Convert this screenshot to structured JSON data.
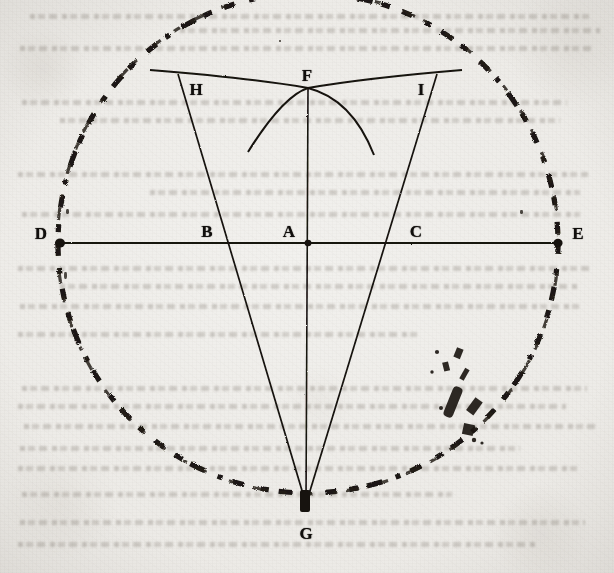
{
  "figure": {
    "medium": "engraved plate on aged paper",
    "paper_color": "#eceae6",
    "ink_color": "#15120f",
    "canvas": {
      "width": 614,
      "height": 573
    },
    "circle": {
      "style": "dashed",
      "center": {
        "x": 308,
        "y": 243
      },
      "radius": 250,
      "dash_count": 60
    },
    "points": [
      {
        "id": "D",
        "label": "D",
        "x": 60,
        "y": 243,
        "label_x": 41,
        "label_y": 233,
        "marker": true,
        "role": "diameter-end-left"
      },
      {
        "id": "B",
        "label": "B",
        "x": 222,
        "y": 243,
        "label_x": 207,
        "label_y": 231,
        "marker": false,
        "role": "chord-intersection-left"
      },
      {
        "id": "A",
        "label": "A",
        "x": 308,
        "y": 243,
        "label_x": 289,
        "label_y": 231,
        "marker": true,
        "role": "center"
      },
      {
        "id": "C",
        "label": "C",
        "x": 397,
        "y": 243,
        "label_x": 416,
        "label_y": 231,
        "marker": false,
        "role": "chord-intersection-right"
      },
      {
        "id": "E",
        "label": "E",
        "x": 558,
        "y": 243,
        "label_x": 578,
        "label_y": 233,
        "marker": true,
        "role": "diameter-end-right"
      },
      {
        "id": "F",
        "label": "F",
        "x": 308,
        "y": 88,
        "label_x": 307,
        "label_y": 75,
        "marker": false,
        "role": "arc-intersection-apex"
      },
      {
        "id": "G",
        "label": "G",
        "x": 306,
        "y": 504,
        "label_x": 306,
        "label_y": 533,
        "marker": true,
        "role": "triangle-apex-bottom"
      },
      {
        "id": "H",
        "label": "H",
        "x": 178,
        "y": 74,
        "label_x": 196,
        "label_y": 89,
        "marker": false,
        "role": "circle-point-left"
      },
      {
        "id": "I",
        "label": "I",
        "x": 437,
        "y": 74,
        "label_x": 421,
        "label_y": 89,
        "marker": false,
        "role": "circle-point-right"
      }
    ],
    "straight_lines": [
      {
        "name": "diameter-DE",
        "from": "D",
        "to": "E"
      },
      {
        "name": "chord-HG",
        "from": "H",
        "to": "G"
      },
      {
        "name": "chord-IG",
        "from": "I",
        "to": "G"
      },
      {
        "name": "axis-FG",
        "from": "F",
        "to": "G"
      }
    ],
    "arcs": [
      {
        "name": "arc-from-H",
        "start": "H",
        "through": "F",
        "direction": "clockwise"
      },
      {
        "name": "arc-from-I",
        "start": "I",
        "through": "F",
        "direction": "counter-clockwise"
      }
    ],
    "bleed_through_text": "faint mirrored letterpress text from the reverse of the leaf"
  }
}
